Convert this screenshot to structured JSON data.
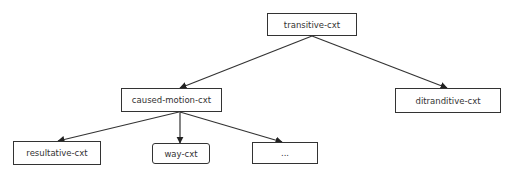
{
  "diagram": {
    "type": "tree",
    "colors": {
      "line": "#333333",
      "text": "#333333",
      "background": "#ffffff"
    },
    "nodes": [
      {
        "id": "transitive",
        "label": "transitive-cxt",
        "x": 267,
        "y": 13,
        "w": 90,
        "h": 23,
        "rounded": false
      },
      {
        "id": "caused",
        "label": "caused-motion-cxt",
        "x": 121,
        "y": 88,
        "w": 101,
        "h": 24,
        "rounded": false
      },
      {
        "id": "ditran",
        "label": "ditranditive-cxt",
        "x": 395,
        "y": 88,
        "w": 106,
        "h": 25,
        "rounded": false
      },
      {
        "id": "result",
        "label": "resultative-cxt",
        "x": 13,
        "y": 141,
        "w": 88,
        "h": 24,
        "rounded": false
      },
      {
        "id": "way",
        "label": "way-cxt",
        "x": 152,
        "y": 143,
        "w": 58,
        "h": 21,
        "rounded": true
      },
      {
        "id": "more",
        "label": "...",
        "x": 252,
        "y": 142,
        "w": 66,
        "h": 22,
        "rounded": false
      }
    ],
    "edges": [
      {
        "from": "transitive",
        "to": "caused",
        "x1": 312,
        "y1": 36,
        "x2": 180,
        "y2": 88
      },
      {
        "from": "transitive",
        "to": "ditran",
        "x1": 312,
        "y1": 36,
        "x2": 447,
        "y2": 88
      },
      {
        "from": "caused",
        "to": "result",
        "x1": 179,
        "y1": 112,
        "x2": 58,
        "y2": 141
      },
      {
        "from": "caused",
        "to": "way",
        "x1": 180,
        "y1": 112,
        "x2": 180,
        "y2": 143
      },
      {
        "from": "caused",
        "to": "more",
        "x1": 180,
        "y1": 112,
        "x2": 282,
        "y2": 142
      }
    ]
  }
}
